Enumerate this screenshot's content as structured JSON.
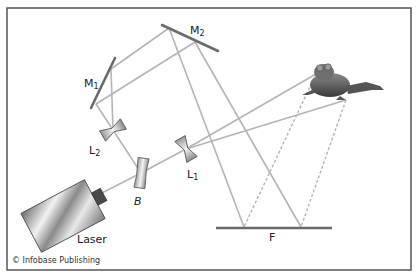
{
  "diagram": {
    "labels": {
      "m1": {
        "main": "M",
        "sub": "1"
      },
      "m2": {
        "main": "M",
        "sub": "2"
      },
      "l1": {
        "main": "L",
        "sub": "1"
      },
      "l2": {
        "main": "L",
        "sub": "2"
      },
      "beam_splitter": "B",
      "laser": "Laser",
      "film": "F"
    },
    "credit": "© Infobase Publishing",
    "colors": {
      "frame": "#555555",
      "beam": "#b4b4b4",
      "mirror": "#6a6a6a",
      "text": "#222222"
    }
  }
}
